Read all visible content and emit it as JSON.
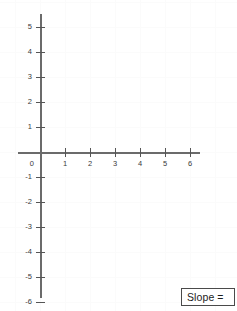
{
  "chart_data": {
    "type": "scatter",
    "title": "",
    "xlabel": "",
    "ylabel": "",
    "xlim": [
      -1,
      7
    ],
    "ylim": [
      -7,
      6
    ],
    "grid": true,
    "legend": null,
    "series": [],
    "x_tick_labels": [
      "1",
      "2",
      "3",
      "4",
      "5",
      "6"
    ],
    "x_tick_values": [
      1,
      2,
      3,
      4,
      5,
      6
    ],
    "y_tick_labels_positive": [
      "1",
      "2",
      "3",
      "4",
      "5"
    ],
    "y_tick_values_positive": [
      1,
      2,
      3,
      4,
      5
    ],
    "y_tick_labels_negative": [
      "-1",
      "-2",
      "-3",
      "-4",
      "-5",
      "-6"
    ],
    "y_tick_values_negative": [
      -1,
      -2,
      -3,
      -4,
      -5,
      -6
    ],
    "origin_label": "0",
    "annotations": [
      "Slope ="
    ]
  },
  "graph": {
    "origin_label": "0",
    "x_ticks": [
      {
        "label": "1",
        "value": 1
      },
      {
        "label": "2",
        "value": 2
      },
      {
        "label": "3",
        "value": 3
      },
      {
        "label": "4",
        "value": 4
      },
      {
        "label": "5",
        "value": 5
      },
      {
        "label": "6",
        "value": 6
      }
    ],
    "y_ticks": [
      {
        "label": "5",
        "value": 5
      },
      {
        "label": "4",
        "value": 4
      },
      {
        "label": "3",
        "value": 3
      },
      {
        "label": "2",
        "value": 2
      },
      {
        "label": "1",
        "value": 1
      },
      {
        "label": "-1",
        "value": -1
      },
      {
        "label": "-2",
        "value": -2
      },
      {
        "label": "-3",
        "value": -3
      },
      {
        "label": "-4",
        "value": -4
      },
      {
        "label": "-5",
        "value": -5
      },
      {
        "label": "-6",
        "value": -6
      }
    ]
  },
  "answer_box": {
    "label": "Slope =",
    "value": ""
  },
  "colors": {
    "axis": "#6b6b6b",
    "tick": "#555555",
    "label": "#3a3a3a",
    "grid": "#fbfbfb",
    "box_border": "#4a4a4a",
    "background": "#ffffff"
  }
}
